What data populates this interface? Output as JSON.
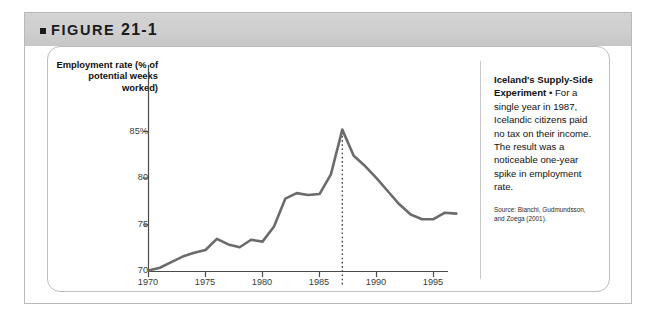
{
  "figure": {
    "bullet_icon": "square-bullet-icon",
    "label": "FIGURE",
    "number": "21-1"
  },
  "chart_data": {
    "type": "line",
    "title": "",
    "ylabel": "Employment rate (% of potential weeks worked)",
    "xlabel": "",
    "ylim": [
      70,
      86.5
    ],
    "xlim": [
      1970,
      1997
    ],
    "yticks": [
      70,
      75,
      80,
      85
    ],
    "ytick_labels": [
      "70",
      "75",
      "80",
      "85%"
    ],
    "xticks": [
      1970,
      1975,
      1980,
      1985,
      1990,
      1995
    ],
    "xtick_labels": [
      "1970",
      "1975",
      "1980",
      "1985",
      "1990",
      "1995"
    ],
    "grid": false,
    "legend": null,
    "line_color": "#6b6b6b",
    "annotations": [
      {
        "name": "peak-year-marker",
        "x": 1987,
        "label": "1987",
        "style": "dotted-vertical-line"
      }
    ],
    "x": [
      1970,
      1971,
      1972,
      1973,
      1974,
      1975,
      1976,
      1977,
      1978,
      1979,
      1980,
      1981,
      1982,
      1983,
      1984,
      1985,
      1986,
      1987,
      1988,
      1989,
      1990,
      1991,
      1992,
      1993,
      1994,
      1995,
      1996,
      1997
    ],
    "values": [
      70.1,
      70.4,
      71.0,
      71.6,
      72.0,
      72.3,
      73.5,
      72.9,
      72.6,
      73.4,
      73.2,
      74.8,
      77.8,
      78.4,
      78.2,
      78.3,
      80.4,
      85.2,
      82.4,
      81.3,
      80.0,
      78.6,
      77.2,
      76.1,
      75.6,
      75.6,
      76.3,
      76.2
    ],
    "series": [
      {
        "name": "Employment rate",
        "color": "#6b6b6b"
      }
    ]
  },
  "caption": {
    "heading": "Iceland's Supply-Side Experiment",
    "separator": " • ",
    "text": "For a single year in 1987, Icelandic citizens paid no tax on their income. The result was a noticeable one-year spike in employment rate.",
    "source": "Source: Bianchi, Gudmundsson, and Zoega (2001)."
  }
}
